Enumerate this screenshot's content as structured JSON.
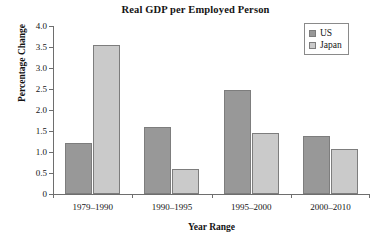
{
  "chart_data": {
    "type": "bar",
    "title": "Real GDP per Employed Person",
    "xlabel": "Year Range",
    "ylabel": "Percentage Change",
    "categories": [
      "1979–1990",
      "1990–1995",
      "1995–2000",
      "2000–2010"
    ],
    "series": [
      {
        "name": "US",
        "color": "#989898",
        "values": [
          1.22,
          1.59,
          2.47,
          1.39
        ]
      },
      {
        "name": "Japan",
        "color": "#cacaca",
        "values": [
          3.55,
          0.6,
          1.45,
          1.07
        ]
      }
    ],
    "ylim": [
      0,
      4.0
    ],
    "yticks": [
      0,
      0.5,
      1.0,
      1.5,
      2.0,
      2.5,
      3.0,
      3.5,
      4.0
    ],
    "ytick_labels": [
      "0",
      "0.5",
      "1.0",
      "1.5",
      "2.0",
      "2.5",
      "3.0",
      "3.5",
      "4.0"
    ],
    "grid": false,
    "legend_position": "top-right"
  },
  "legend": {
    "entries": [
      {
        "label": "US",
        "swatch": "series-us"
      },
      {
        "label": "Japan",
        "swatch": "series-japan"
      }
    ]
  }
}
